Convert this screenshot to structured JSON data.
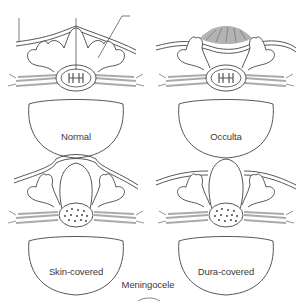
{
  "panels": [
    {
      "id": "normal",
      "label": "Normal"
    },
    {
      "id": "occulta",
      "label": "Occulta"
    },
    {
      "id": "skin-covered",
      "label": "Skin-covered"
    },
    {
      "id": "dura-covered",
      "label": "Dura-covered"
    }
  ],
  "group_label": "Meningocele",
  "colors": {
    "line": "#444444",
    "nerve": "#bdbdbd",
    "tuft": "#8a8a8a",
    "background": "#ffffff"
  }
}
